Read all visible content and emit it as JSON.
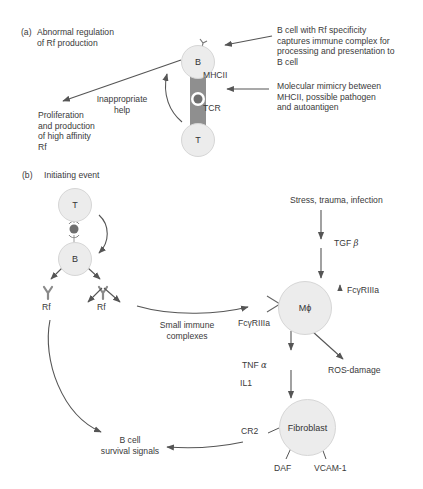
{
  "panel_a": {
    "tag": "(a)",
    "title": "Abnormal regulation\nof Rf production",
    "b_cell": "B",
    "t_cell": "T",
    "mhcii": "MHCII",
    "tcr": "TCR",
    "help": "Inappropriate\nhelp",
    "proliferation": "Proliferation\nand production\nof high affinity\nRf",
    "note_capture": "B cell with Rf specificity\ncaptures immune complex for\nprocessing and presentation to\nB cell",
    "note_mimicry": "Molecular mimicry between\nMHCII, possible pathogen\nand autoantigen"
  },
  "panel_b": {
    "tag": "(b)",
    "title": "Initiating event",
    "t_cell": "T",
    "b_cell": "B",
    "rf_left": "Rf",
    "rf_right": "Rf",
    "small_immune": "Small immune\ncomplexes",
    "stress": "Stress, trauma, infection",
    "tgf": "TGF",
    "tgf_greek": "β",
    "fc_up_arrow": "↑",
    "fc_up": "FcγRIIIa",
    "fc_left": "FcγRIIIa",
    "macrophage": "Mϕ",
    "tnf": "TNF",
    "tnf_greek": "α",
    "il1": "IL1",
    "ros": "ROS-damage",
    "fibroblast": "Fibroblast",
    "cr2": "CR2",
    "daf": "DAF",
    "vcam": "VCAM-1",
    "bcell_survival": "B cell\nsurvival signals"
  },
  "colors": {
    "cell_fill": "#ececec",
    "cell_border": "#d6d6d6",
    "arrow": "#555555",
    "synapse": "#8a8a8a",
    "synapse_dot": "#777777",
    "text": "#3a3a3a"
  }
}
